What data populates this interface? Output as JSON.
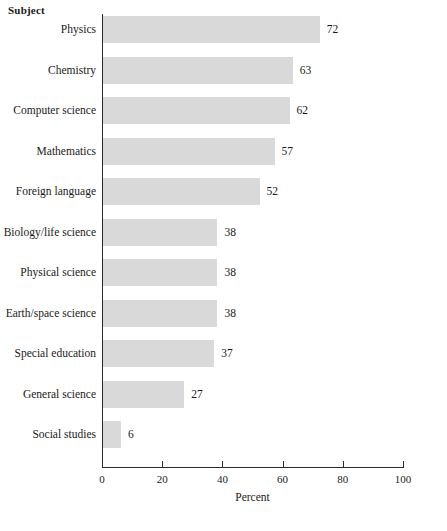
{
  "chart_data": {
    "type": "bar",
    "orientation": "horizontal",
    "title": "",
    "ylabel": "Subject",
    "xlabel": "Percent",
    "categories": [
      "Physics",
      "Chemistry",
      "Computer science",
      "Mathematics",
      "Foreign language",
      "Biology/life science",
      "Physical science",
      "Earth/space science",
      "Special education",
      "General science",
      "Social studies"
    ],
    "values": [
      72,
      63,
      62,
      57,
      52,
      38,
      38,
      38,
      37,
      27,
      6
    ],
    "value_labels": [
      "72",
      "63",
      "62",
      "57",
      "52",
      "38",
      "38",
      "38",
      "37",
      "27",
      "6"
    ],
    "xlim": [
      0,
      100
    ],
    "xticks": [
      0,
      20,
      40,
      60,
      80,
      100
    ],
    "xtick_labels": [
      "0",
      "20",
      "40",
      "60",
      "80",
      "100"
    ],
    "grid": false,
    "legend": null,
    "bar_color": "#d9d9d9",
    "axis_color": "#2b2b2b",
    "text_color": "#1a1a1a"
  }
}
